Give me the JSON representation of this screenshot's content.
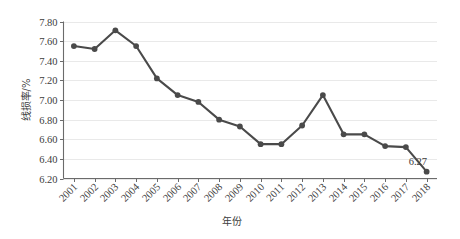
{
  "chart_data": {
    "type": "line",
    "title": "",
    "xlabel": "年份",
    "ylabel": "线损率/%",
    "categories": [
      "2001",
      "2002",
      "2003",
      "2004",
      "2005",
      "2006",
      "2007",
      "2008",
      "2009",
      "2010",
      "2011",
      "2012",
      "2013",
      "2014",
      "2015",
      "2016",
      "2017",
      "2018"
    ],
    "values": [
      7.55,
      7.52,
      7.71,
      7.55,
      7.22,
      7.05,
      6.98,
      6.8,
      6.73,
      6.55,
      6.55,
      6.74,
      7.05,
      6.65,
      6.65,
      6.53,
      6.52,
      6.27
    ],
    "series": [
      {
        "name": "线损率",
        "values": [
          7.55,
          7.52,
          7.71,
          7.55,
          7.22,
          7.05,
          6.98,
          6.8,
          6.73,
          6.55,
          6.55,
          6.74,
          7.05,
          6.65,
          6.65,
          6.53,
          6.52,
          6.27
        ]
      }
    ],
    "ylim": [
      6.2,
      7.8
    ],
    "ytick_labels": [
      "6.20",
      "6.40",
      "6.60",
      "6.80",
      "7.00",
      "7.20",
      "7.40",
      "7.60",
      "7.80"
    ],
    "ytick_values": [
      6.2,
      6.4,
      6.6,
      6.8,
      7.0,
      7.2,
      7.4,
      7.6,
      7.8
    ],
    "grid": true,
    "legend": false,
    "legend_position": "none",
    "annotations": [
      {
        "text": "6.27",
        "category": "2018",
        "value": 6.27
      }
    ],
    "marker": "circle",
    "series_color": "#4a4a4a",
    "grid_color": "#e3e3e3",
    "axis_color": "#6b6b6b",
    "xtick_rotation": 45
  }
}
